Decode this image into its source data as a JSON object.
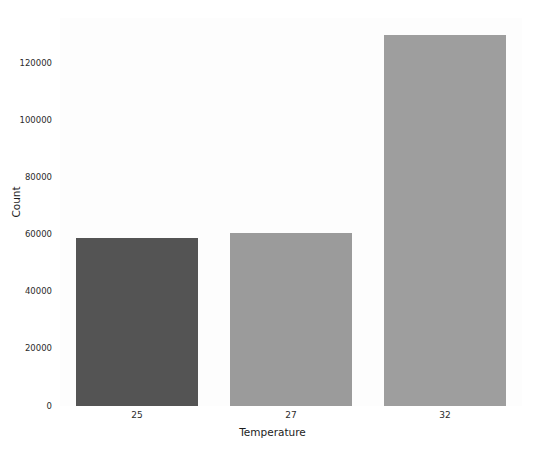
{
  "chart_data": {
    "type": "bar",
    "title": "",
    "xlabel": "Temperature",
    "ylabel": "Count",
    "categories": [
      "25",
      "27",
      "32"
    ],
    "values": [
      59000,
      60500,
      130000
    ],
    "series": [
      {
        "name": "Count",
        "values": [
          59000,
          60500,
          130000
        ]
      }
    ],
    "ylim": [
      0,
      136000
    ],
    "yticks": [
      0,
      20000,
      40000,
      60000,
      80000,
      100000,
      120000
    ],
    "ytick_labels": [
      "0",
      "20000",
      "40000",
      "60000",
      "80000",
      "100000",
      "120000"
    ],
    "xtick_labels": [
      "25",
      "27",
      "32"
    ],
    "grid": false,
    "legend": "none",
    "bar_colors": [
      "#545454",
      "#9b9b9b",
      "#9e9e9e"
    ],
    "background": "#ffffff",
    "plot_background": "#fdfdfd"
  }
}
